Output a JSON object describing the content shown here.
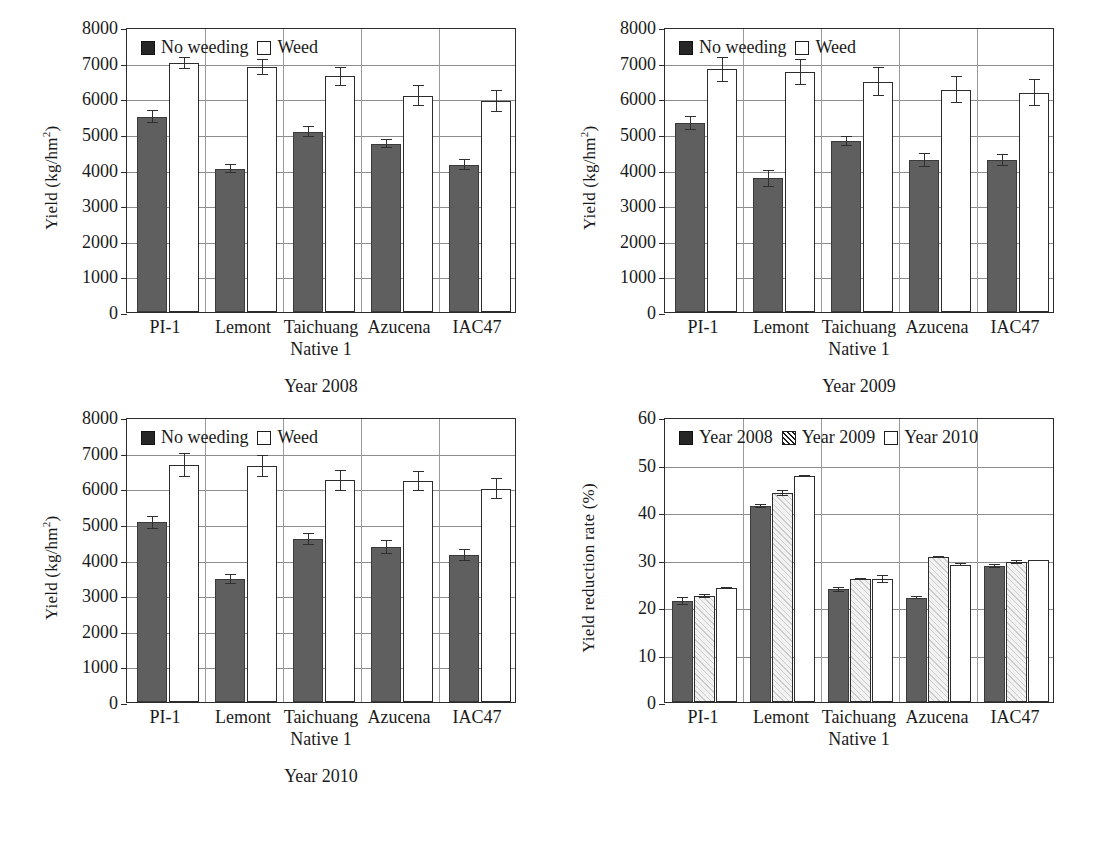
{
  "figure": {
    "categories": [
      "PI-1",
      "Lemont",
      "Taichuang",
      "Azucena",
      "IAC47"
    ],
    "xlabel": "Native 1"
  },
  "chart_data": [
    {
      "id": "yield-2008",
      "type": "bar",
      "title": "Year 2008",
      "caption": "Year 2008",
      "xlabel": "Native 1",
      "ylabel": "Yield (kg/hm2)",
      "ylabel_base": "Yield (kg/hm",
      "ylabel_sup": "2",
      "ylabel_tail": ")",
      "ylim": [
        0,
        8000
      ],
      "yticks": [
        0,
        1000,
        2000,
        3000,
        4000,
        5000,
        6000,
        7000,
        8000
      ],
      "grid": true,
      "legend_position": "top-left",
      "categories": [
        "PI-1",
        "Lemont",
        "Taichuang",
        "Azucena",
        "IAC47"
      ],
      "series": [
        {
          "name": "No weeding",
          "style": "dark",
          "values": [
            5480,
            4020,
            5060,
            4730,
            4140
          ],
          "errors": [
            180,
            130,
            150,
            120,
            160
          ]
        },
        {
          "name": "Weed",
          "style": "white",
          "values": [
            6990,
            6880,
            6620,
            6070,
            5920
          ],
          "errors": [
            160,
            230,
            270,
            290,
            300
          ]
        }
      ]
    },
    {
      "id": "yield-2009",
      "type": "bar",
      "title": "Year 2009",
      "caption": "Year 2009",
      "xlabel": "Native 1",
      "ylabel": "Yield (kg/hm2)",
      "ylabel_base": "Yield (kg/hm",
      "ylabel_sup": "2",
      "ylabel_tail": ")",
      "ylim": [
        0,
        8000
      ],
      "yticks": [
        0,
        1000,
        2000,
        3000,
        4000,
        5000,
        6000,
        7000,
        8000
      ],
      "grid": true,
      "legend_position": "top-left",
      "categories": [
        "PI-1",
        "Lemont",
        "Taichuang",
        "Azucena",
        "IAC47"
      ],
      "series": [
        {
          "name": "No weeding",
          "style": "dark",
          "values": [
            5310,
            3750,
            4800,
            4260,
            4270
          ],
          "errors": [
            200,
            230,
            140,
            200,
            170
          ]
        },
        {
          "name": "Weed",
          "style": "white",
          "values": [
            6810,
            6740,
            6470,
            6240,
            6160
          ],
          "errors": [
            340,
            360,
            400,
            380,
            380
          ]
        }
      ]
    },
    {
      "id": "yield-2010",
      "type": "bar",
      "title": "Year 2010",
      "caption": "Year 2010",
      "xlabel": "Native 1",
      "ylabel": "Yield (kg/hm2)",
      "ylabel_base": "Yield (kg/hm",
      "ylabel_sup": "2",
      "ylabel_tail": ")",
      "ylim": [
        0,
        8000
      ],
      "yticks": [
        0,
        1000,
        2000,
        3000,
        4000,
        5000,
        6000,
        7000,
        8000
      ],
      "grid": true,
      "legend_position": "top-left",
      "categories": [
        "PI-1",
        "Lemont",
        "Taichuang",
        "Azucena",
        "IAC47"
      ],
      "series": [
        {
          "name": "No weeding",
          "style": "dark",
          "values": [
            5040,
            3450,
            4570,
            4350,
            4130
          ],
          "errors": [
            180,
            130,
            170,
            190,
            160
          ]
        },
        {
          "name": "Weed",
          "style": "white",
          "values": [
            6660,
            6630,
            6220,
            6210,
            5990
          ],
          "errors": [
            330,
            300,
            290,
            280,
            290
          ]
        }
      ]
    },
    {
      "id": "yield-reduction-rate",
      "type": "bar",
      "title": "Yield reduction rate (%)",
      "caption": "",
      "xlabel": "Native 1",
      "ylabel": "Yield reduction rate (%)",
      "ylabel_base": "Yield reduction rate (%)",
      "ylabel_sup": "",
      "ylabel_tail": "",
      "ylim": [
        0,
        60
      ],
      "yticks": [
        0,
        10,
        20,
        30,
        40,
        50,
        60
      ],
      "grid": true,
      "legend_position": "top-left",
      "categories": [
        "PI-1",
        "Lemont",
        "Taichuang",
        "Azucena",
        "IAC47"
      ],
      "series": [
        {
          "name": "Year 2008",
          "style": "dark",
          "values": [
            21.3,
            41.2,
            23.7,
            22.0,
            28.7
          ],
          "errors": [
            0.9,
            0.4,
            0.6,
            0.3,
            0.4
          ]
        },
        {
          "name": "Year 2009",
          "style": "hatch",
          "values": [
            22.3,
            44.0,
            25.9,
            30.5,
            29.5
          ],
          "errors": [
            0.5,
            0.7,
            0.3,
            0.2,
            0.5
          ]
        },
        {
          "name": "Year 2010",
          "style": "white",
          "values": [
            24.1,
            47.5,
            25.9,
            28.9,
            29.8
          ],
          "errors": [
            0.2,
            0.2,
            0.8,
            0.3,
            0.2
          ]
        }
      ]
    }
  ]
}
